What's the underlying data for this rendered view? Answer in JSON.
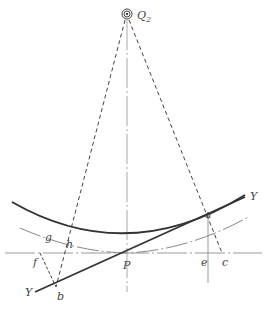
{
  "diagram": {
    "labels": {
      "Q": "Q",
      "Q_sub": "2",
      "P": "P",
      "a": "a",
      "b": "b",
      "c": "c",
      "e": "e",
      "f": "f",
      "g": "g",
      "h": "h",
      "Y_left": "Y",
      "Y_right": "Y"
    },
    "colors": {
      "thick_line": "#333333",
      "thin_line": "#888888",
      "dashed_line": "#444444"
    }
  }
}
